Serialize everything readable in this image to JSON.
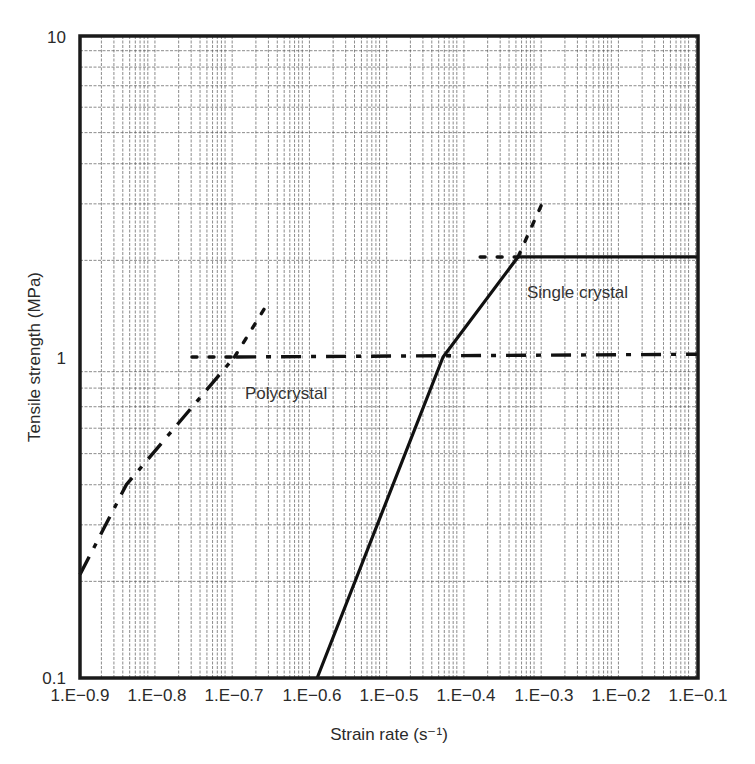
{
  "chart_data": {
    "type": "line",
    "title": "",
    "xlabel": "Strain rate (s⁻¹)",
    "ylabel": "Tensile strength (MPa)",
    "x_tick_labels": [
      "1.E−0.9",
      "1.E−0.8",
      "1.E−0.7",
      "1.E−0.6",
      "1.E−0.5",
      "1.E−0.4",
      "1.E−0.3",
      "1.E−0.2",
      "1.E−0.1"
    ],
    "y_tick_labels": [
      "10",
      "1",
      "0.1"
    ],
    "yscale": "log",
    "ylim": [
      0.1,
      10
    ],
    "xlim_index": [
      0,
      8
    ],
    "grid": true,
    "legend": null,
    "series": [
      {
        "name": "Single crystal",
        "style": "solid",
        "points": [
          {
            "x_index": 3.07,
            "y": 0.1
          },
          {
            "x_index": 4.7,
            "y": 1.0
          },
          {
            "x_index": 5.67,
            "y": 2.05
          },
          {
            "x_index": 8.0,
            "y": 2.05
          }
        ],
        "extensions": [
          {
            "style": "dotted",
            "from": {
              "x_index": 5.67,
              "y": 2.05
            },
            "to": {
              "x_index": 5.98,
              "y": 3.0
            }
          },
          {
            "style": "dotted",
            "from": {
              "x_index": 5.18,
              "y": 2.05
            },
            "to": {
              "x_index": 5.67,
              "y": 2.05
            }
          }
        ]
      },
      {
        "name": "Polycrystal",
        "style": "dash-dot",
        "points": [
          {
            "x_index": 0.0,
            "y": 0.21
          },
          {
            "x_index": 0.6,
            "y": 0.4
          },
          {
            "x_index": 2.0,
            "y": 1.0
          },
          {
            "x_index": 8.0,
            "y": 1.02
          }
        ],
        "extensions": [
          {
            "style": "dotted",
            "from": {
              "x_index": 2.0,
              "y": 1.0
            },
            "to": {
              "x_index": 2.43,
              "y": 1.47
            }
          },
          {
            "style": "dotted",
            "from": {
              "x_index": 1.45,
              "y": 1.0
            },
            "to": {
              "x_index": 2.0,
              "y": 1.0
            }
          }
        ]
      }
    ],
    "annotations": [
      {
        "text": "Single crystal",
        "x_index": 5.7,
        "y": 1.6
      },
      {
        "text": "Polycrystal",
        "x_index": 2.1,
        "y": 0.8
      }
    ]
  },
  "plot": {
    "left": 80,
    "right": 698,
    "top": 36,
    "bottom": 678,
    "frame_color": "#1a1a1a",
    "line_color": "#111111"
  }
}
